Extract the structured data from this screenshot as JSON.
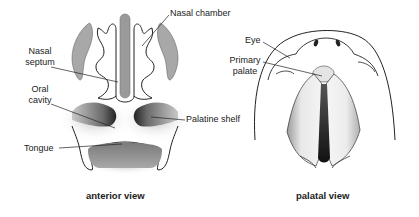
{
  "figure": {
    "panels": [
      {
        "id": "anterior",
        "caption": "anterior view",
        "labels": {
          "nasal_chamber": "Nasal chamber",
          "nasal_septum_line1": "Nasal",
          "nasal_septum_line2": "septum",
          "oral_cavity_line1": "Oral",
          "oral_cavity_line2": "cavity",
          "palatine_shelf": "Palatine shelf",
          "tongue": "Tongue"
        }
      },
      {
        "id": "palatal",
        "caption": "palatal view",
        "labels": {
          "eye": "Eye",
          "primary_palate_line1": "Primary",
          "primary_palate_line2": "palate"
        }
      }
    ],
    "colors": {
      "line": "#222222",
      "gray_fill": "#9a9a9a",
      "dark_shade": "#2a2a2a",
      "background": "#ffffff"
    }
  }
}
